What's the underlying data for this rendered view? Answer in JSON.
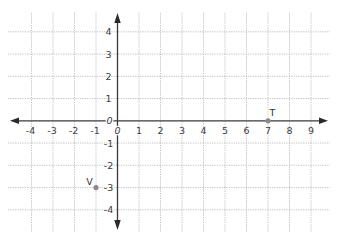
{
  "chart_data": {
    "type": "scatter",
    "title": "",
    "xlabel": "",
    "ylabel": "",
    "xlim": [
      -4,
      9
    ],
    "ylim": [
      -4,
      4
    ],
    "grid": true,
    "grid_style": "dotted",
    "axes_arrows": true,
    "x_ticks": [
      -4,
      -3,
      -2,
      -1,
      0,
      1,
      2,
      3,
      4,
      5,
      6,
      7,
      8,
      9
    ],
    "x_tick_labels": [
      "-4",
      "-3",
      "-2",
      "-1",
      "0",
      "1",
      "2",
      "3",
      "4",
      "5",
      "6",
      "7",
      "8",
      "9"
    ],
    "y_ticks": [
      4,
      3,
      2,
      1,
      0,
      -1,
      -2,
      -3,
      -4
    ],
    "y_tick_labels": [
      "4",
      "3",
      "2",
      "1",
      "0",
      "-1",
      "-2",
      "-3",
      "-4"
    ],
    "points": [
      {
        "label": "T",
        "x": 7,
        "y": 0
      },
      {
        "label": "V",
        "x": -1,
        "y": -3
      }
    ]
  },
  "colors": {
    "grid": "#b9b9b9",
    "axis": "#3a3a3a",
    "point": "#8a8a8a",
    "label": "#3c3c3c"
  }
}
